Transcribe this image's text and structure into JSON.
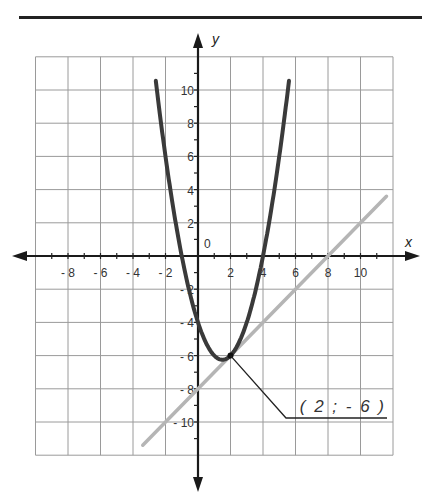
{
  "chart_data": {
    "type": "line",
    "title": "",
    "xlabel": "x",
    "ylabel": "y",
    "xlim": [
      -10,
      12
    ],
    "ylim": [
      -12,
      12
    ],
    "grid": true,
    "x_tick_labels": [
      "- 8",
      "- 6",
      "- 4",
      "- 2",
      "2",
      "4",
      "6",
      "8",
      "10"
    ],
    "x_ticks": [
      -8,
      -6,
      -4,
      -2,
      2,
      4,
      6,
      8,
      10
    ],
    "y_tick_labels": [
      "10",
      "8",
      "6",
      "4",
      "2",
      "- 2",
      "- 4",
      "- 6",
      "- 8",
      "- 10"
    ],
    "y_ticks": [
      10,
      8,
      6,
      4,
      2,
      -2,
      -4,
      -6,
      -8,
      -10
    ],
    "origin_label": "0",
    "series": [
      {
        "name": "parabola",
        "equation": "y = x^2 - 3x - 4",
        "color": "#3a3a3a",
        "x": [
          -2.6,
          -2,
          -1,
          0,
          1,
          1.5,
          2,
          3,
          4,
          5,
          5.6
        ],
        "y": [
          11.56,
          6,
          0,
          -4,
          -6,
          -6.25,
          -6,
          -4,
          0,
          6,
          10.56
        ]
      },
      {
        "name": "tangent line",
        "equation": "y = x - 8",
        "color": "#b5b5b5",
        "x": [
          -3.4,
          0,
          2,
          8,
          11.6
        ],
        "y": [
          -11.4,
          -8,
          -6,
          0,
          3.6
        ]
      }
    ],
    "annotations": [
      {
        "text": "( 2 ; - 6 )",
        "point": [
          2,
          -6
        ]
      }
    ]
  }
}
